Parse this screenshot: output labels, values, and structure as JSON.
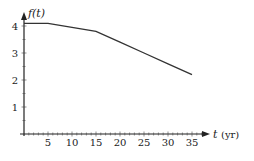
{
  "chart_data": {
    "type": "line",
    "title": "",
    "xlabel": "t",
    "xunit": "(yr)",
    "ylabel": "f(t)",
    "xlim": [
      0,
      37
    ],
    "ylim": [
      0,
      4.5
    ],
    "xticks": [
      5,
      10,
      15,
      20,
      25,
      30,
      35
    ],
    "yticks": [
      1,
      2,
      3,
      4
    ],
    "grid": false,
    "series": [
      {
        "name": "f(t)",
        "x": [
          0,
          5,
          10,
          15,
          20,
          25,
          30,
          35
        ],
        "y": [
          4.1,
          4.1,
          3.95,
          3.8,
          3.4,
          3.0,
          2.6,
          2.2
        ]
      }
    ]
  },
  "labels": {
    "y_axis": "f(t)",
    "x_axis": "t",
    "x_unit": "(yr)",
    "x_ticks": [
      "5",
      "10",
      "15",
      "20",
      "25",
      "30",
      "35"
    ],
    "y_ticks": [
      "1",
      "2",
      "3",
      "4"
    ]
  }
}
